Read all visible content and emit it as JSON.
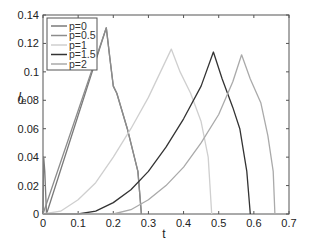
{
  "chart_data": {
    "type": "line",
    "title": "",
    "xlabel": "t",
    "ylabel": "I_e",
    "xlim": [
      0,
      0.7
    ],
    "ylim": [
      0,
      0.14
    ],
    "grid": false,
    "legend_position": "upper-left",
    "x_ticks": [
      "0",
      "0.1",
      "0.2",
      "0.3",
      "0.4",
      "0.5",
      "0.6",
      "0.7"
    ],
    "y_ticks": [
      "0",
      "0.02",
      "0.04",
      "0.06",
      "0.08",
      "0.1",
      "0.12",
      "0.14"
    ],
    "series": [
      {
        "name": "p=0",
        "color": "#7a7a7a",
        "points": [
          [
            0,
            0
          ],
          [
            0.002,
            0.04
          ],
          [
            0.005,
            0.03
          ],
          [
            0.01,
            0.0
          ],
          [
            0.18,
            0.131
          ],
          [
            0.19,
            0.11
          ],
          [
            0.2,
            0.09
          ],
          [
            0.21,
            0.085
          ],
          [
            0.24,
            0.06
          ],
          [
            0.27,
            0.03
          ],
          [
            0.28,
            0.0
          ]
        ]
      },
      {
        "name": "p=0.5",
        "color": "#8c8c8c",
        "points": [
          [
            0,
            0
          ],
          [
            0.18,
            0.131
          ],
          [
            0.19,
            0.11
          ],
          [
            0.2,
            0.09
          ],
          [
            0.21,
            0.085
          ],
          [
            0.24,
            0.06
          ],
          [
            0.27,
            0.03
          ],
          [
            0.28,
            0.0
          ]
        ]
      },
      {
        "name": "p=1",
        "color": "#cfcfcf",
        "points": [
          [
            0,
            0
          ],
          [
            0.05,
            0.002
          ],
          [
            0.1,
            0.01
          ],
          [
            0.15,
            0.022
          ],
          [
            0.2,
            0.04
          ],
          [
            0.25,
            0.06
          ],
          [
            0.3,
            0.082
          ],
          [
            0.365,
            0.116
          ],
          [
            0.39,
            0.1
          ],
          [
            0.42,
            0.085
          ],
          [
            0.45,
            0.065
          ],
          [
            0.47,
            0.04
          ],
          [
            0.48,
            0.0
          ]
        ]
      },
      {
        "name": "p=1.5",
        "color": "#333333",
        "points": [
          [
            0,
            0
          ],
          [
            0.1,
            0.0
          ],
          [
            0.15,
            0.002
          ],
          [
            0.2,
            0.008
          ],
          [
            0.25,
            0.017
          ],
          [
            0.3,
            0.03
          ],
          [
            0.35,
            0.047
          ],
          [
            0.4,
            0.067
          ],
          [
            0.45,
            0.09
          ],
          [
            0.485,
            0.114
          ],
          [
            0.51,
            0.095
          ],
          [
            0.54,
            0.075
          ],
          [
            0.56,
            0.06
          ],
          [
            0.58,
            0.03
          ],
          [
            0.59,
            0.0
          ]
        ]
      },
      {
        "name": "p=2",
        "color": "#aaaaaa",
        "points": [
          [
            0,
            0
          ],
          [
            0.2,
            0.0
          ],
          [
            0.25,
            0.003
          ],
          [
            0.3,
            0.01
          ],
          [
            0.35,
            0.02
          ],
          [
            0.4,
            0.033
          ],
          [
            0.45,
            0.05
          ],
          [
            0.5,
            0.07
          ],
          [
            0.54,
            0.093
          ],
          [
            0.565,
            0.112
          ],
          [
            0.59,
            0.095
          ],
          [
            0.62,
            0.078
          ],
          [
            0.64,
            0.055
          ],
          [
            0.655,
            0.03
          ],
          [
            0.66,
            0.0
          ]
        ]
      }
    ]
  },
  "legend": {
    "items": [
      {
        "label": "p=0",
        "color": "#7a7a7a"
      },
      {
        "label": "p=0.5",
        "color": "#8c8c8c"
      },
      {
        "label": "p=1",
        "color": "#cfcfcf"
      },
      {
        "label": "p=1.5",
        "color": "#333333"
      },
      {
        "label": "p=2",
        "color": "#aaaaaa"
      }
    ]
  },
  "axes": {
    "xlabel": "t",
    "ylabel_main": "I",
    "ylabel_sub": "e"
  }
}
